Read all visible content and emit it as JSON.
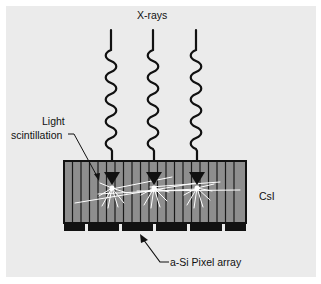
{
  "diagram": {
    "labels": {
      "xrays": "X-rays",
      "light": "Light",
      "scintillation": "scintillation",
      "csi": "CsI",
      "pixel_array": "a-Si Pixel array"
    },
    "colors": {
      "background": "#ebebeb",
      "margin": "#ffffff",
      "scintillator_fill": "#8e8e8e",
      "scintillator_lines": "#1a1a1a",
      "pixel_pads": "#111111",
      "light_rays": "#ffffff",
      "xray_stroke": "#111111"
    },
    "xray_beams": [
      {
        "x": 112,
        "label": "beam-1"
      },
      {
        "x": 154,
        "label": "beam-2"
      },
      {
        "x": 197,
        "label": "beam-3"
      }
    ],
    "scintillator": {
      "name": "CsI",
      "column_count": 21
    },
    "pixel_array": {
      "name": "a-Si Pixel array",
      "pad_count": 6
    }
  }
}
